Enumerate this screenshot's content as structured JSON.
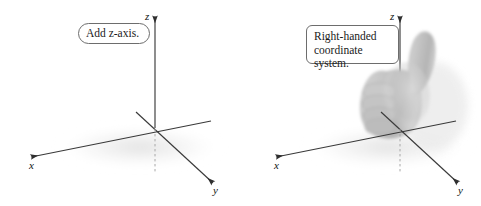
{
  "figure": {
    "background_color": "#ffffff",
    "axis_color": "#3a3a3a",
    "dashed_color": "#a8a8a8",
    "hand_color": "#c6c6c6",
    "shadow_color": "#ededed",
    "callout_border_color": "#6d6d6d",
    "text_color": "#1a1a1a"
  },
  "panels": [
    {
      "id": "left-panel",
      "callout": {
        "lines": "Add z-axis.",
        "shape": "rounded-pill"
      },
      "axes": {
        "x_label": "x",
        "y_label": "y",
        "z_label": "z"
      },
      "has_hand": false
    },
    {
      "id": "right-panel",
      "callout": {
        "lines": "Right-handed\ncoordinate system.",
        "shape": "rounded-rect"
      },
      "axes": {
        "x_label": "x",
        "y_label": "y",
        "z_label": "z"
      },
      "has_hand": true,
      "hand_description": "right-hand-thumbs-up"
    }
  ]
}
